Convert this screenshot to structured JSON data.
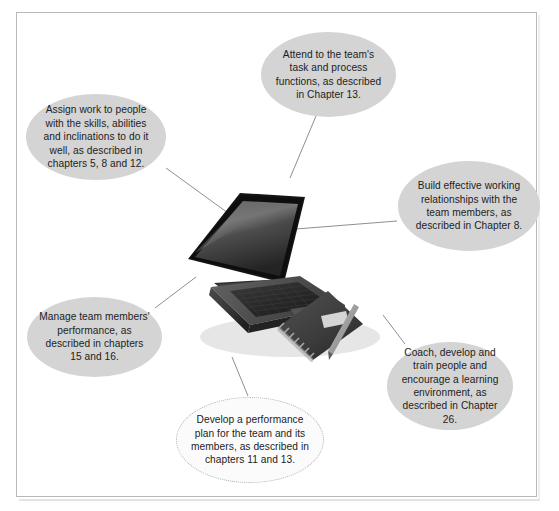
{
  "figure": {
    "center_image": {
      "name": "laptop-notebook-pen-photo",
      "description": "Open laptop computer with spiral notebook and pen, grayscale photograph"
    },
    "frame": {
      "border_color": "#b9b9b9",
      "background_color": "#ffffff"
    },
    "bubble_style": {
      "fill": "#d4d4d4",
      "light_fill": "#fbfbfb",
      "text_color": "#1d1d1d",
      "connector_color": "#8f8f8f"
    },
    "bubbles": [
      {
        "id": "assign-work",
        "text": "Assign work to people with the skills, abilities and inclinations to do it well, as described in chapters 5, 8 and 12."
      },
      {
        "id": "attend-team",
        "text": "Attend to the team's task and process functions, as described in Chapter 13."
      },
      {
        "id": "build-relationships",
        "text": "Build effective working relationships with the team members, as described in Chapter 8."
      },
      {
        "id": "coach-develop",
        "text": "Coach, develop and train people and encourage a learning environment, as described in Chapter 26."
      },
      {
        "id": "develop-plan",
        "text": "Develop a performance plan for the team and its members, as described in chapters 11 and 13."
      },
      {
        "id": "manage-performance",
        "text": "Manage team members' performance, as described in chapters 15 and 16."
      }
    ]
  }
}
